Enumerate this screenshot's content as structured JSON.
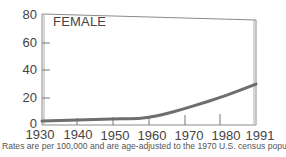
{
  "chart_data": {
    "type": "line",
    "title": "FEMALE",
    "xlabel": "",
    "ylabel": "",
    "x": [
      1930,
      1935,
      1940,
      1945,
      1950,
      1955,
      1960,
      1965,
      1970,
      1975,
      1980,
      1985,
      1991
    ],
    "series": [
      {
        "name": "Female",
        "values": [
          1.5,
          1.8,
          2.2,
          2.6,
          3.0,
          3.1,
          3.7,
          6.5,
          10.0,
          14.0,
          18.0,
          22.5,
          28.5
        ]
      }
    ],
    "x_ticks": [
      "1930",
      "1940",
      "1950",
      "1960",
      "1970",
      "1980",
      "1991"
    ],
    "y_ticks": [
      "0",
      "20",
      "40",
      "60",
      "80"
    ],
    "ylim": [
      0,
      80
    ],
    "xlim": [
      1930,
      1991
    ],
    "grid": false,
    "legend": null,
    "annotation": "Rates are per 100,000 and are age-adjusted to the 1970 U.S. census population."
  },
  "labels": {
    "title": "FEMALE",
    "y_ticks": [
      "80",
      "60",
      "40",
      "20",
      "0"
    ],
    "x_ticks": [
      "1930",
      "1940",
      "1950",
      "1960",
      "1970",
      "1980",
      "1991"
    ],
    "footnote": "Rates are per 100,000 and are age-adjusted to the 1970 U.S. census population."
  },
  "colors": {
    "line": "#6e6e6e",
    "axis": "#7a7a7a",
    "text": "#444444"
  }
}
